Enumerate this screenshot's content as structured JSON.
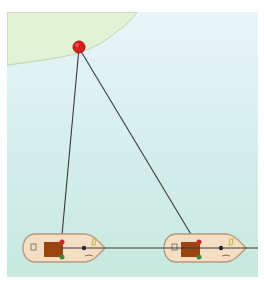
{
  "diagram": {
    "colors": {
      "water_top": "#e6f4f8",
      "water_bottom": "#c9eae0",
      "land": "#e3f1d4",
      "coastline": "#b9d6a8",
      "point": "#d81e1e",
      "line": "#3a3a3a",
      "hull_fill": "#f4dfc4",
      "hull_stroke": "#b69a7e",
      "cabin": "#9a4410",
      "port_light": "#cc2a2a",
      "starboard_light": "#3f8a3a",
      "marking": "#c8b84c"
    },
    "shore_point": {
      "label": "shore-point",
      "x": 72,
      "y": 35
    },
    "boats": [
      {
        "name": "boat-1",
        "x": 16,
        "y": 222,
        "anchor_x": 54,
        "anchor_y": 234
      },
      {
        "name": "boat-2",
        "x": 157,
        "y": 222,
        "anchor_x": 191,
        "anchor_y": 234
      }
    ],
    "tow_line": {
      "y": 236,
      "x1": 54,
      "x2": 251
    }
  }
}
